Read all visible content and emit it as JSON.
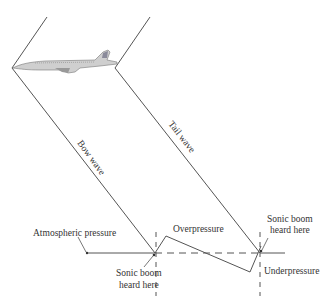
{
  "diagram": {
    "labels": {
      "bow_wave": "Bow wave",
      "tail_wave": "Tail wave",
      "atmospheric_pressure": "Atmospheric pressure",
      "overpressure": "Overpressure",
      "underpressure": "Underpressure",
      "sonic_boom_1_line1": "Sonic boom",
      "sonic_boom_1_line2": "heard here",
      "sonic_boom_2_line1": "Sonic boom",
      "sonic_boom_2_line2": "heard here"
    },
    "elements": {
      "aircraft": "supersonic-jet-icon",
      "wave_shape": "N-wave"
    },
    "colors": {
      "line": "#555555",
      "text": "#333333",
      "background": "#ffffff"
    }
  }
}
